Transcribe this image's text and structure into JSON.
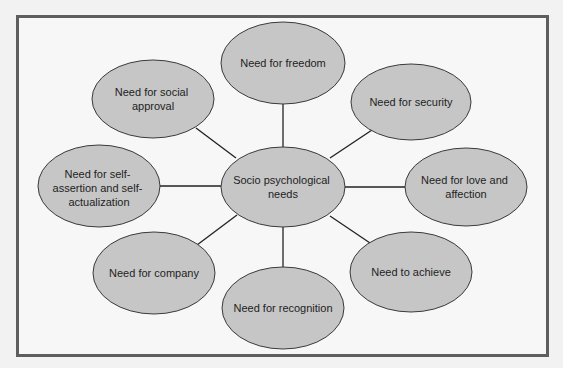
{
  "diagram": {
    "type": "mind-map",
    "colors": {
      "node_fill": "#c6c6c6",
      "node_stroke": "#3a3a3a",
      "connector": "#222222",
      "frame": "#5e5e5e"
    },
    "center": {
      "label_lines": [
        "Socio psychological",
        "needs"
      ]
    },
    "nodes": [
      {
        "id": "freedom",
        "label_lines": [
          "Need for freedom"
        ]
      },
      {
        "id": "security",
        "label_lines": [
          "Need for security"
        ]
      },
      {
        "id": "love",
        "label_lines": [
          "Need for love and",
          "affection"
        ]
      },
      {
        "id": "achieve",
        "label_lines": [
          "Need to achieve"
        ]
      },
      {
        "id": "recognition",
        "label_lines": [
          "Need for recognition"
        ]
      },
      {
        "id": "company",
        "label_lines": [
          "Need for company"
        ]
      },
      {
        "id": "self",
        "label_lines": [
          "Need for self-",
          "assertion and self-",
          "actualization"
        ]
      },
      {
        "id": "social",
        "label_lines": [
          "Need for social",
          "approval"
        ]
      }
    ]
  }
}
